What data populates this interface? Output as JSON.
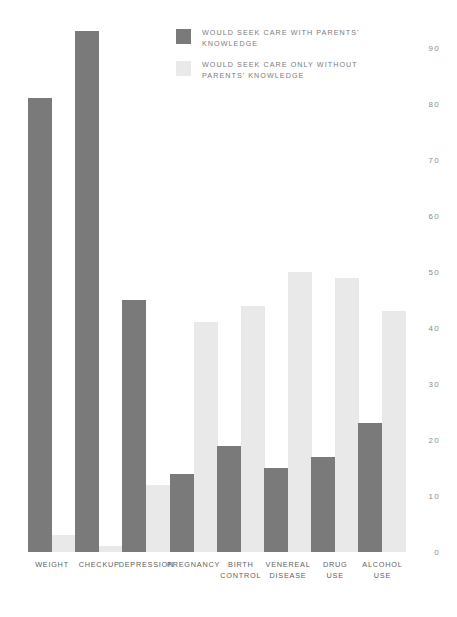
{
  "chart_data": {
    "type": "bar",
    "title": "",
    "subtitle": "",
    "xlabel": "",
    "ylabel": "",
    "ylim": [
      0,
      95
    ],
    "grid": false,
    "legend_position": "top-center",
    "yticks": [
      0,
      10,
      20,
      30,
      40,
      50,
      60,
      70,
      80,
      90
    ],
    "ytick_labels": [
      "0",
      "10",
      "20",
      "30",
      "40",
      "50",
      "60",
      "70",
      "80",
      "90"
    ],
    "categories": [
      "WEIGHT",
      "CHECKUP",
      "DEPRESSION",
      "PREGNANCY",
      "BIRTH\nCONTROL",
      "VENEREAL\nDISEASE",
      "DRUG\nUSE",
      "ALCOHOL\nUSE"
    ],
    "series": [
      {
        "name": "WOULD SEEK CARE WITH PARENTS'\nKNOWLEDGE",
        "color": "#7a7a7a",
        "values": [
          81,
          93,
          45,
          14,
          19,
          15,
          17,
          23
        ]
      },
      {
        "name": "WOULD SEEK CARE ONLY WITHOUT\nPARENTS' KNOWLEDGE",
        "color": "#e9e9e9",
        "values": [
          3,
          1,
          12,
          41,
          44,
          50,
          49,
          43
        ]
      }
    ]
  },
  "colors": {
    "dark_series": "#7a7a7a",
    "light_series": "#e9e9e9",
    "axis_text": "#8a8a8a",
    "label_text": "#5f5f5f",
    "legend_text": "#7b7b7b",
    "background": "#ffffff"
  }
}
